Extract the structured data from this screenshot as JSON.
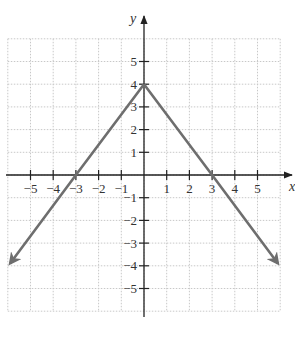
{
  "chart_data": {
    "type": "line",
    "title": "",
    "xlabel": "x",
    "ylabel": "y",
    "xlim": [
      -6,
      6
    ],
    "ylim": [
      -6,
      6
    ],
    "grid": true,
    "x_ticks": [
      -5,
      -4,
      -3,
      -2,
      -1,
      1,
      2,
      3,
      4,
      5
    ],
    "y_ticks": [
      5,
      4,
      3,
      2,
      1,
      -1,
      -2,
      -3,
      -4,
      -5
    ],
    "x_tick_labels": [
      "−5",
      "−4",
      "−3",
      "−2",
      "−1",
      "1",
      "2",
      "3",
      "4",
      "5"
    ],
    "y_tick_labels": [
      "5",
      "4",
      "3",
      "2",
      "1",
      "−1",
      "−2",
      "−3",
      "−4",
      "−5"
    ],
    "series": [
      {
        "name": "y = 4 − (4/3)|x|",
        "points": [
          [
            -5.9,
            -3.9
          ],
          [
            -3,
            0
          ],
          [
            0,
            4
          ],
          [
            3,
            0
          ],
          [
            5.9,
            -3.9
          ]
        ],
        "arrows_at_ends": true,
        "color": "#6e6e6e"
      }
    ],
    "annotations": {
      "vertex": [
        0,
        4
      ],
      "x_intercepts": [
        -3,
        3
      ]
    }
  },
  "colors": {
    "axis": "#222222",
    "grid": "#c8c8c8",
    "line": "#6e6e6e"
  }
}
